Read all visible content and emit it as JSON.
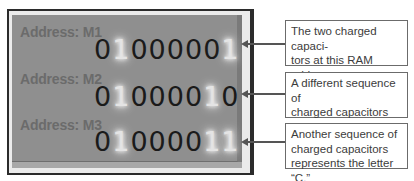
{
  "diagram": {
    "rows": [
      {
        "address_label": "Address: M1",
        "bits": [
          "0",
          "1",
          "0",
          "0",
          "0",
          "0",
          "0",
          "1"
        ],
        "charged": [
          false,
          true,
          false,
          false,
          false,
          false,
          false,
          true
        ],
        "callout": "The two charged capaci- tors at this RAM address represent the letter “A.”",
        "callout_lines": [
          "The two charged capaci-",
          "tors at this RAM address",
          "represent the letter “A.”"
        ]
      },
      {
        "address_label": "Address: M2",
        "bits": [
          "0",
          "1",
          "0",
          "0",
          "0",
          "0",
          "1",
          "0"
        ],
        "charged": [
          false,
          true,
          false,
          false,
          false,
          false,
          true,
          false
        ],
        "callout": "A different sequence of charged capacitors represents the letter “B.”",
        "callout_lines": [
          "A different sequence of",
          "charged capacitors",
          "represents the letter “B.”"
        ]
      },
      {
        "address_label": "Address: M3",
        "bits": [
          "0",
          "1",
          "0",
          "0",
          "0",
          "0",
          "1",
          "1"
        ],
        "charged": [
          false,
          true,
          false,
          false,
          false,
          false,
          true,
          true
        ],
        "callout": "Another sequence of charged capacitors represents the letter “C.”",
        "callout_lines": [
          "Another sequence of",
          "charged capacitors",
          "represents the letter “C.”"
        ]
      }
    ],
    "colors": {
      "panel": "#8f8f8f",
      "bit_off": "#1a1a1a",
      "bit_on": "#e4e4e4",
      "label": "#6b6b6b",
      "arrow": "#555555"
    }
  }
}
